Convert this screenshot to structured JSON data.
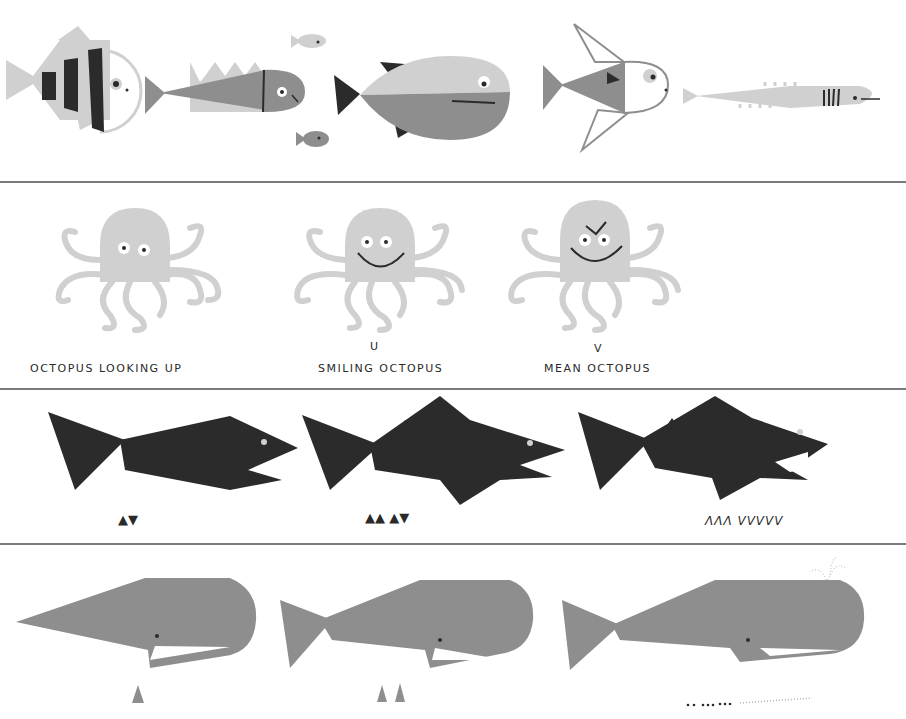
{
  "colors": {
    "paper": "#ffffff",
    "light_gray": "#d0d0d0",
    "mid_gray": "#8e8e8e",
    "dark": "#2b2b2b",
    "divider": "#7a7a7a"
  },
  "rows": [
    {
      "name": "fish",
      "figures": [
        "striped-angelfish",
        "spiky-fish",
        "small-fish-top",
        "small-fish-bottom",
        "round-fish",
        "outline-fish",
        "long-fish"
      ]
    },
    {
      "name": "octopus",
      "figures": [
        {
          "id": "octopus-looking-up",
          "label": "OCTOPUS LOOKING UP",
          "mark": ""
        },
        {
          "id": "smiling-octopus",
          "label": "SMILING OCTOPUS",
          "mark": "U"
        },
        {
          "id": "mean-octopus",
          "label": "MEAN OCTOPUS",
          "mark": "V"
        }
      ]
    },
    {
      "name": "shark",
      "figures": [
        {
          "id": "shark-1",
          "teeth": "▲▼"
        },
        {
          "id": "shark-2",
          "teeth": "▲▲ ▲▼"
        },
        {
          "id": "shark-3",
          "teeth": "ΛΛΛ VVVVV"
        }
      ]
    },
    {
      "name": "whale",
      "figures": [
        "whale-1",
        "whale-2",
        "whale-3-spouting"
      ]
    }
  ]
}
